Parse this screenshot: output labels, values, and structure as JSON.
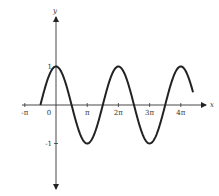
{
  "chart_data": {
    "type": "line",
    "title": "",
    "function": "y = cos(x)",
    "xlabel": "x",
    "ylabel": "y",
    "xlim": [
      -3.14159,
      14.1
    ],
    "ylim": [
      -2.2,
      2.3
    ],
    "x_ticks": [
      {
        "value": -3.14159,
        "label": "-π"
      },
      {
        "value": 0,
        "label": "0"
      },
      {
        "value": 3.14159,
        "label": "π"
      },
      {
        "value": 6.28319,
        "label": "2π"
      },
      {
        "value": 9.42478,
        "label": "3π"
      },
      {
        "value": 12.56637,
        "label": "4π"
      }
    ],
    "y_ticks": [
      {
        "value": 1,
        "label": "1"
      },
      {
        "value": -1,
        "label": "-1"
      }
    ],
    "series": [
      {
        "name": "cos(x)",
        "x_start": -1.5708,
        "x_end": 13.8,
        "color": "#222222",
        "key_points": [
          {
            "x": -1.5708,
            "y": 0
          },
          {
            "x": 0,
            "y": 1
          },
          {
            "x": 3.14159,
            "y": -1
          },
          {
            "x": 6.28319,
            "y": 1
          },
          {
            "x": 9.42478,
            "y": -1
          },
          {
            "x": 12.56637,
            "y": 1
          },
          {
            "x": 13.8,
            "y": 0.33
          }
        ]
      }
    ],
    "grid": false,
    "legend": "none"
  },
  "labels": {
    "x_axis": "x",
    "y_axis": "y"
  }
}
